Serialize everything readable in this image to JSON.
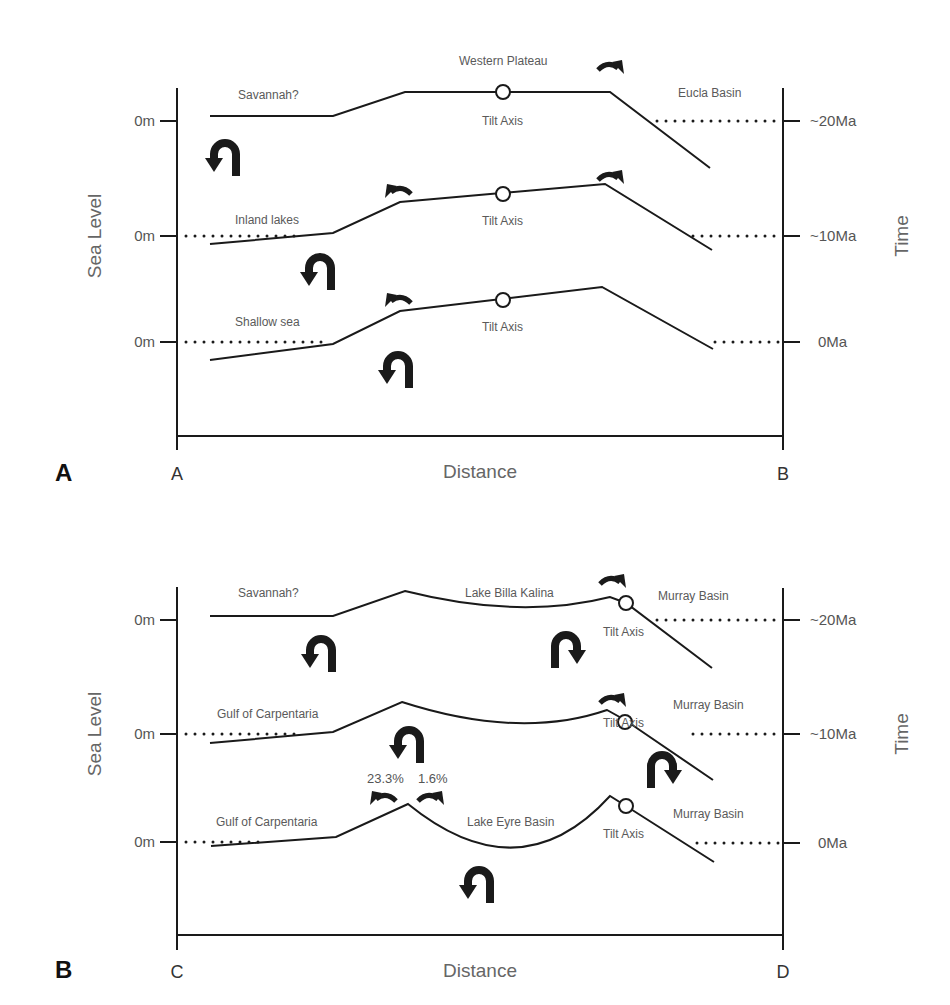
{
  "panels": [
    {
      "id": "A",
      "panel_label": "A",
      "x_axis": {
        "title": "Distance",
        "start_label": "A",
        "end_label": "B"
      },
      "y_left": {
        "title": "Sea Level",
        "ticks": [
          "0m",
          "0m",
          "0m"
        ]
      },
      "y_right": {
        "title": "Time",
        "ticks": [
          "~20Ma",
          "~10Ma",
          "0Ma"
        ]
      },
      "labels": {
        "top_left": "Savannah?",
        "top_center": "Western Plateau",
        "top_right": "Eucla Basin",
        "top_axis": "Tilt Axis",
        "mid_left": "Inland lakes",
        "mid_axis": "Tilt Axis",
        "bot_left": "Shallow sea",
        "bot_axis": "Tilt Axis"
      }
    },
    {
      "id": "B",
      "panel_label": "B",
      "x_axis": {
        "title": "Distance",
        "start_label": "C",
        "end_label": "D"
      },
      "y_left": {
        "title": "Sea Level",
        "ticks": [
          "0m",
          "0m",
          "0m"
        ]
      },
      "y_right": {
        "title": "Time",
        "ticks": [
          "~20Ma",
          "~10Ma",
          "0Ma"
        ]
      },
      "labels": {
        "top_left": "Savannah?",
        "top_center": "Lake Billa Kalina",
        "top_right": "Murray Basin",
        "top_axis": "Tilt Axis",
        "mid_left": "Gulf of Carpentaria",
        "mid_right": "Murray Basin",
        "mid_axis": "Tilt Axis",
        "bot_left": "Gulf of Carpentaria",
        "bot_center": "Lake Eyre Basin",
        "bot_right": "Murray Basin",
        "bot_axis": "Tilt Axis",
        "pct_left": "23.3%",
        "pct_right": "1.6%"
      }
    }
  ]
}
